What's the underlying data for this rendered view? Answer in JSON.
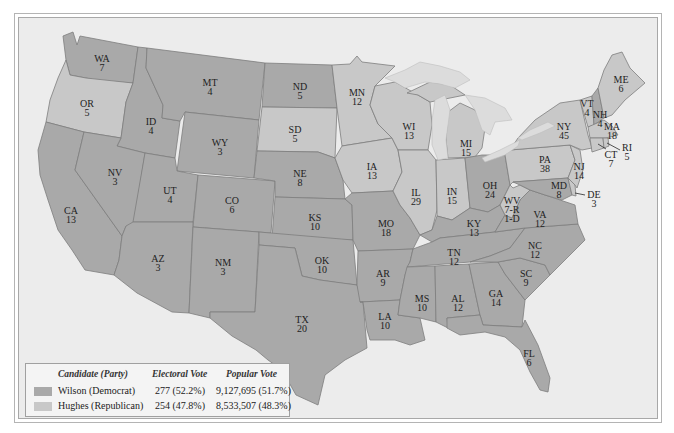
{
  "colors": {
    "democrat": "#a9a9a9",
    "republican": "#c8c8c8",
    "lakes": "#dcdcdc",
    "background": "#ececec"
  },
  "legend": {
    "headers": {
      "candidate": "Candidate (Party)",
      "electoral": "Electoral Vote",
      "popular": "Popular Vote"
    },
    "rows": [
      {
        "candidate": "Wilson (Democrat)",
        "electoral": "277 (52.2%)",
        "popular": "9,127,695 (51.7%)",
        "party": "democrat"
      },
      {
        "candidate": "Hughes (Republican)",
        "electoral": "254 (47.8%)",
        "popular": "8,533,507 (48.3%)",
        "party": "republican"
      }
    ]
  },
  "states": [
    {
      "abbr": "WA",
      "votes": "7",
      "party": "democrat",
      "x": 102,
      "y": 62
    },
    {
      "abbr": "OR",
      "votes": "5",
      "party": "republican",
      "x": 87,
      "y": 107
    },
    {
      "abbr": "CA",
      "votes": "13",
      "party": "democrat",
      "x": 71,
      "y": 214
    },
    {
      "abbr": "ID",
      "votes": "4",
      "party": "democrat",
      "x": 151,
      "y": 125
    },
    {
      "abbr": "NV",
      "votes": "3",
      "party": "democrat",
      "x": 115,
      "y": 176
    },
    {
      "abbr": "MT",
      "votes": "4",
      "party": "democrat",
      "x": 210,
      "y": 86
    },
    {
      "abbr": "WY",
      "votes": "3",
      "party": "democrat",
      "x": 220,
      "y": 146
    },
    {
      "abbr": "UT",
      "votes": "4",
      "party": "democrat",
      "x": 170,
      "y": 194
    },
    {
      "abbr": "CO",
      "votes": "6",
      "party": "democrat",
      "x": 232,
      "y": 204
    },
    {
      "abbr": "AZ",
      "votes": "3",
      "party": "democrat",
      "x": 158,
      "y": 262
    },
    {
      "abbr": "NM",
      "votes": "3",
      "party": "democrat",
      "x": 223,
      "y": 266
    },
    {
      "abbr": "ND",
      "votes": "5",
      "party": "democrat",
      "x": 300,
      "y": 90
    },
    {
      "abbr": "SD",
      "votes": "5",
      "party": "republican",
      "x": 295,
      "y": 133
    },
    {
      "abbr": "NE",
      "votes": "8",
      "party": "democrat",
      "x": 300,
      "y": 177
    },
    {
      "abbr": "KS",
      "votes": "10",
      "party": "democrat",
      "x": 315,
      "y": 221
    },
    {
      "abbr": "OK",
      "votes": "10",
      "party": "democrat",
      "x": 322,
      "y": 264
    },
    {
      "abbr": "TX",
      "votes": "20",
      "party": "democrat",
      "x": 302,
      "y": 323
    },
    {
      "abbr": "MN",
      "votes": "12",
      "party": "republican",
      "x": 357,
      "y": 96
    },
    {
      "abbr": "IA",
      "votes": "13",
      "party": "republican",
      "x": 372,
      "y": 170
    },
    {
      "abbr": "MO",
      "votes": "18",
      "party": "democrat",
      "x": 386,
      "y": 227
    },
    {
      "abbr": "AR",
      "votes": "9",
      "party": "democrat",
      "x": 383,
      "y": 277
    },
    {
      "abbr": "LA",
      "votes": "10",
      "party": "democrat",
      "x": 385,
      "y": 320
    },
    {
      "abbr": "WI",
      "votes": "13",
      "party": "republican",
      "x": 409,
      "y": 130
    },
    {
      "abbr": "IL",
      "votes": "29",
      "party": "republican",
      "x": 416,
      "y": 196
    },
    {
      "abbr": "MI",
      "votes": "15",
      "party": "republican",
      "x": 466,
      "y": 147
    },
    {
      "abbr": "IN",
      "votes": "15",
      "party": "republican",
      "x": 452,
      "y": 195
    },
    {
      "abbr": "OH",
      "votes": "24",
      "party": "democrat",
      "x": 490,
      "y": 189
    },
    {
      "abbr": "KY",
      "votes": "13",
      "party": "democrat",
      "x": 474,
      "y": 227
    },
    {
      "abbr": "TN",
      "votes": "12",
      "party": "democrat",
      "x": 454,
      "y": 256
    },
    {
      "abbr": "MS",
      "votes": "10",
      "party": "democrat",
      "x": 422,
      "y": 302
    },
    {
      "abbr": "AL",
      "votes": "12",
      "party": "democrat",
      "x": 458,
      "y": 302
    },
    {
      "abbr": "GA",
      "votes": "14",
      "party": "democrat",
      "x": 496,
      "y": 297
    },
    {
      "abbr": "FL",
      "votes": "6",
      "party": "democrat",
      "x": 529,
      "y": 357
    },
    {
      "abbr": "SC",
      "votes": "9",
      "party": "democrat",
      "x": 526,
      "y": 277
    },
    {
      "abbr": "NC",
      "votes": "12",
      "party": "democrat",
      "x": 535,
      "y": 249
    },
    {
      "abbr": "VA",
      "votes": "12",
      "party": "democrat",
      "x": 540,
      "y": 218
    },
    {
      "abbr": "WV",
      "votes": "7-R",
      "votes2": "1-D",
      "party": "republican",
      "x": 512,
      "y": 204
    },
    {
      "abbr": "PA",
      "votes": "38",
      "party": "republican",
      "x": 545,
      "y": 163
    },
    {
      "abbr": "NY",
      "votes": "45",
      "party": "republican",
      "x": 564,
      "y": 130
    },
    {
      "abbr": "MD",
      "votes": "8",
      "party": "democrat",
      "x": 559,
      "y": 189
    },
    {
      "abbr": "DE",
      "votes": "3",
      "party": "republican",
      "x": 594,
      "y": 198
    },
    {
      "abbr": "NJ",
      "votes": "14",
      "party": "republican",
      "x": 579,
      "y": 170
    },
    {
      "abbr": "CT",
      "votes": "7",
      "party": "republican",
      "x": 611,
      "y": 158
    },
    {
      "abbr": "RI",
      "votes": "5",
      "party": "republican",
      "x": 627,
      "y": 151
    },
    {
      "abbr": "MA",
      "votes": "18",
      "party": "republican",
      "x": 612,
      "y": 130
    },
    {
      "abbr": "VT",
      "votes": "4",
      "party": "republican",
      "x": 587,
      "y": 107
    },
    {
      "abbr": "NH",
      "votes": "4",
      "party": "democrat",
      "x": 600,
      "y": 118
    },
    {
      "abbr": "ME",
      "votes": "6",
      "party": "republican",
      "x": 621,
      "y": 83
    }
  ]
}
